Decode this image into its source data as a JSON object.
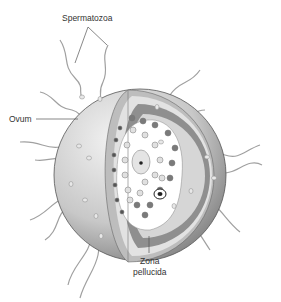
{
  "diagram": {
    "labels": {
      "spermatozoa": "Spermatozoa",
      "ovum": "Ovum",
      "zona_line1": "Zona",
      "zona_line2": "pellucida"
    },
    "colors": {
      "outer_shell_light": "#e6e6e6",
      "outer_shell_dark": "#8a8a8a",
      "zona_band": "#9a9a9a",
      "inner_light": "#d9d9d9",
      "cytoplasm": "#ffffff",
      "granule_dark": "#7a7a7a",
      "granule_light": "#d8d8d8",
      "sperm": "#9a9a9a"
    }
  }
}
